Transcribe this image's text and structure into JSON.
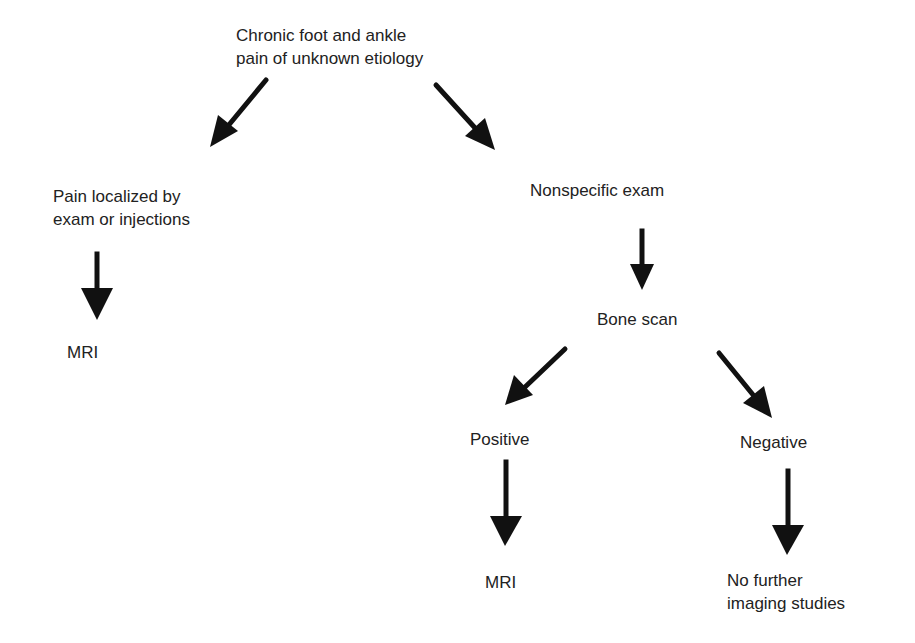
{
  "diagram": {
    "type": "flowchart",
    "colors": {
      "background": "#ffffff",
      "text": "#222222",
      "arrow": "#111111"
    },
    "nodes": {
      "root": {
        "lines": [
          "Chronic foot and ankle",
          "pain of unknown etiology"
        ]
      },
      "localized": {
        "lines": [
          "Pain localized by",
          "exam or injections"
        ]
      },
      "mri_left": {
        "lines": [
          "MRI"
        ]
      },
      "nonspecific": {
        "lines": [
          "Nonspecific exam"
        ]
      },
      "bone_scan": {
        "lines": [
          "Bone scan"
        ]
      },
      "positive": {
        "lines": [
          "Positive"
        ]
      },
      "negative": {
        "lines": [
          "Negative"
        ]
      },
      "mri_right": {
        "lines": [
          "MRI"
        ]
      },
      "no_further": {
        "lines": [
          "No further",
          "imaging studies"
        ]
      }
    },
    "edges": [
      {
        "from": "root",
        "to": "localized"
      },
      {
        "from": "root",
        "to": "nonspecific"
      },
      {
        "from": "localized",
        "to": "mri_left"
      },
      {
        "from": "nonspecific",
        "to": "bone_scan"
      },
      {
        "from": "bone_scan",
        "to": "positive"
      },
      {
        "from": "bone_scan",
        "to": "negative"
      },
      {
        "from": "positive",
        "to": "mri_right"
      },
      {
        "from": "negative",
        "to": "no_further"
      }
    ]
  }
}
